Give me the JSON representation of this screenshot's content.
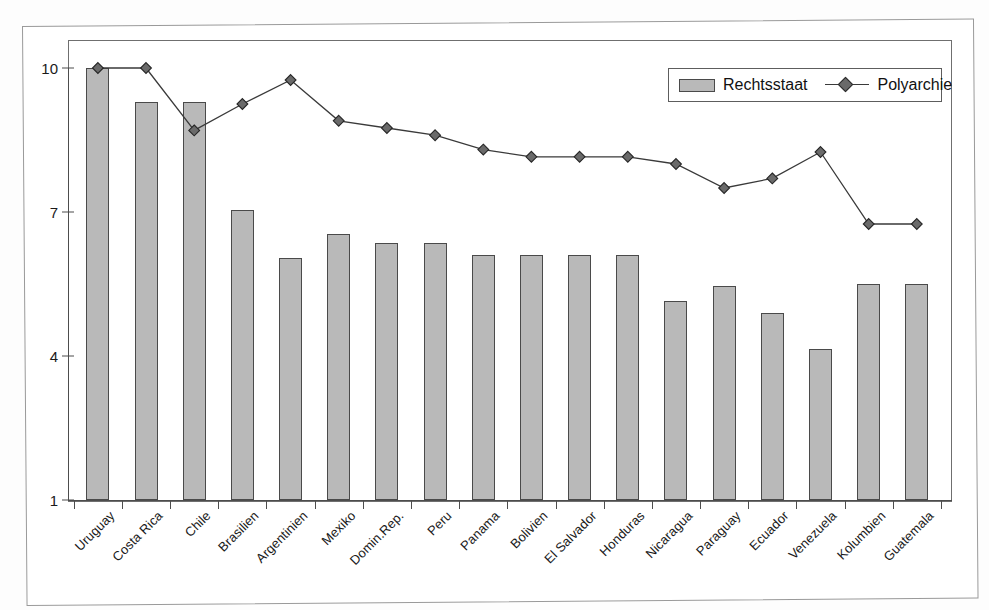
{
  "chart_data": {
    "type": "bar",
    "title": "",
    "subtitle": "",
    "xlabel": "",
    "ylabel": "",
    "ylim": [
      1,
      10
    ],
    "yticks": [
      1,
      4,
      7,
      10
    ],
    "grid": false,
    "legend_position": "top-right",
    "categories": [
      "Uruguay",
      "Costa Rica",
      "Chile",
      "Brasilien",
      "Argentinien",
      "Mexiko",
      "Domin.Rep.",
      "Peru",
      "Panama",
      "Bolivien",
      "El Salvador",
      "Honduras",
      "Nicaragua",
      "Paraguay",
      "Ecuador",
      "Venezuela",
      "Kolumbien",
      "Guatemala"
    ],
    "series": [
      {
        "name": "Rechtsstaat",
        "type": "bar",
        "color": "#b9b9b9",
        "values": [
          10.0,
          9.3,
          9.3,
          7.05,
          6.05,
          6.55,
          6.35,
          6.35,
          6.1,
          6.1,
          6.1,
          6.1,
          5.15,
          5.45,
          4.9,
          4.15,
          5.5,
          5.5
        ]
      },
      {
        "name": "Polyarchie",
        "type": "line",
        "color": "#3a3a3a",
        "marker": "diamond",
        "values": [
          10.0,
          10.0,
          8.7,
          9.25,
          9.75,
          8.9,
          8.75,
          8.6,
          8.3,
          8.15,
          8.15,
          8.15,
          8.0,
          7.5,
          7.7,
          8.25,
          6.75,
          6.75
        ]
      }
    ]
  },
  "legend": {
    "entries": [
      {
        "label": "Rechtsstaat",
        "marker": "bar-swatch"
      },
      {
        "label": "Polyarchie",
        "marker": "line-diamond"
      }
    ]
  },
  "axes": {
    "y_tick_labels": [
      "10",
      "7",
      "4",
      "1"
    ]
  }
}
